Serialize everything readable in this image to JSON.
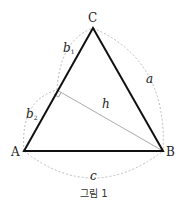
{
  "diagram": {
    "vertices": {
      "A": {
        "label": "A",
        "x": 24,
        "y": 151
      },
      "B": {
        "label": "B",
        "x": 163,
        "y": 151
      },
      "C": {
        "label": "C",
        "x": 93,
        "y": 28
      }
    },
    "foot_of_altitude": {
      "x": 57,
      "y": 90
    },
    "labels": {
      "a": "a",
      "b1": "b",
      "b1_sub": "1",
      "b2": "b",
      "b2_sub": "2",
      "c": "c",
      "h": "h",
      "A": "A",
      "B": "B",
      "C": "C"
    },
    "caption": "그림 1",
    "colors": {
      "triangle": "#111111",
      "altitude": "#aaaaaa",
      "arcs": "#bbbbbb"
    }
  }
}
